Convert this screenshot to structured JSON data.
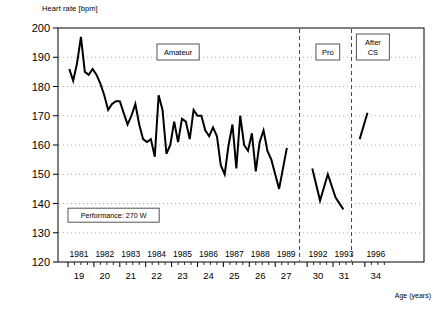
{
  "chart_data": {
    "type": "line",
    "title": "",
    "ylabel": "Heart rate [bpm]",
    "xlabel": "Age (years)",
    "ylim": [
      120,
      200
    ],
    "yticks": [
      120,
      130,
      140,
      150,
      160,
      170,
      180,
      190,
      200
    ],
    "grid": true,
    "grid_style": "dotted-horizontal",
    "legend": "none",
    "x_axis": {
      "primary_label_name": "Year",
      "secondary_label_name": "Age (years)",
      "year_ticks": [
        "1981",
        "1982",
        "1983",
        "1984",
        "1985",
        "1986",
        "1987",
        "1988",
        "1989",
        "1992",
        "1993",
        "1996"
      ],
      "age_ticks": [
        "19",
        "20",
        "21",
        "22",
        "23",
        "24",
        "25",
        "26",
        "27",
        "30",
        "31",
        "34"
      ],
      "minor_ticks_per_year": 4
    },
    "annotations": [
      {
        "name": "amateur",
        "text": "Amateur"
      },
      {
        "name": "pro",
        "text": "Pro"
      },
      {
        "name": "after-cs",
        "text": "After\nCS"
      },
      {
        "name": "performance",
        "text": "Performance: 270 W"
      }
    ],
    "phase_boxes": [
      {
        "label": "Amateur",
        "line1": "Amateur",
        "line2": ""
      },
      {
        "label": "Pro",
        "line1": "Pro",
        "line2": ""
      },
      {
        "label": "After CS",
        "line1": "After",
        "line2": "CS"
      }
    ],
    "note_box": {
      "text": "Performance: 270 W"
    },
    "separators": [
      {
        "after_year": "1989",
        "style": "dashed"
      },
      {
        "after_year": "1993",
        "style": "dashed"
      }
    ],
    "series": [
      {
        "name": "Heart rate at 270 W",
        "color": "#000000",
        "segments": [
          {
            "phase": "Amateur",
            "x": [
              19.05,
              19.2,
              19.35,
              19.5,
              19.65,
              19.8,
              19.95,
              20.1,
              20.25,
              20.4,
              20.55,
              20.7,
              20.85,
              21.0,
              21.15,
              21.3,
              21.45,
              21.6,
              21.75,
              21.9,
              22.05,
              22.2,
              22.35,
              22.5,
              22.65,
              22.8,
              22.95,
              23.1,
              23.25,
              23.4,
              23.55,
              23.7,
              23.85,
              24.0,
              24.15,
              24.3,
              24.45,
              24.6,
              24.75,
              24.9,
              25.05,
              25.2,
              25.35,
              25.5,
              25.65,
              25.8,
              25.95,
              26.1,
              26.25,
              26.4,
              26.55,
              26.7,
              26.85,
              27.0,
              27.15,
              27.3,
              27.45
            ],
            "y": [
              186,
              182,
              188,
              197,
              185,
              184,
              186,
              184,
              181,
              177,
              172,
              174,
              175,
              175,
              171,
              167,
              170,
              174,
              167,
              162,
              161,
              162,
              156,
              177,
              172,
              157,
              160,
              168,
              161,
              169,
              168,
              162,
              172,
              170,
              170,
              165,
              163,
              166,
              163,
              153,
              150,
              160,
              167,
              152,
              170,
              160,
              158,
              164,
              151,
              161,
              165,
              158,
              155,
              150,
              145,
              152,
              159
            ]
          },
          {
            "phase": "Pro",
            "x": [
              30.2,
              30.5,
              30.8,
              31.1,
              31.4
            ],
            "y": [
              152,
              141,
              150,
              142,
              138
            ]
          },
          {
            "phase": "After CS",
            "x": [
              33.8,
              34.1
            ],
            "y": [
              162,
              171
            ]
          }
        ]
      }
    ]
  },
  "figure": {
    "y_axis_title": "Heart rate [bpm]",
    "x_axis_title": "Age (years)"
  }
}
